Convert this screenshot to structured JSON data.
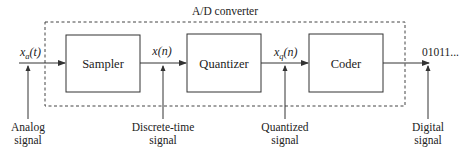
{
  "title": "A/D converter",
  "blocks": [
    {
      "label": "Sampler"
    },
    {
      "label": "Quantizer"
    },
    {
      "label": "Coder"
    }
  ],
  "signals": {
    "input": {
      "base": "x",
      "sub": "a",
      "arg": "(t)"
    },
    "sampled": {
      "base": "x",
      "arg": "(n)"
    },
    "quantized": {
      "base": "x",
      "sub": "q",
      "arg": "(n)"
    },
    "output": "01011..."
  },
  "annotations": [
    {
      "line1": "Analog",
      "line2": "signal"
    },
    {
      "line1": "Discrete-time",
      "line2": "signal"
    },
    {
      "line1": "Quantized",
      "line2": "signal"
    },
    {
      "line1": "Digital",
      "line2": "signal"
    }
  ],
  "colors": {
    "stroke": "#333333",
    "text": "#222222"
  }
}
